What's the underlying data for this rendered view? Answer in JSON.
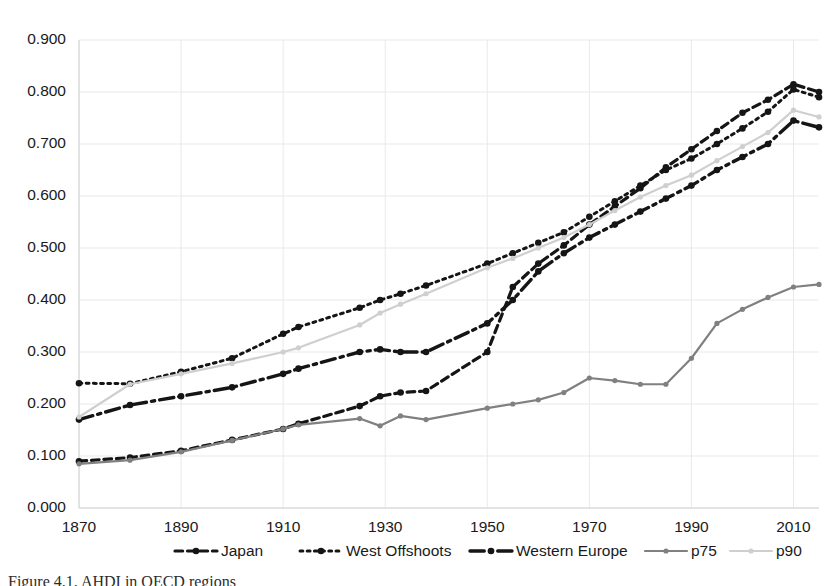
{
  "caption": "Figure 4.1. AHDI in OECD regions",
  "chart_data": {
    "type": "line",
    "title": "",
    "subtitle": "",
    "xlabel": "",
    "ylabel": "",
    "xlim": [
      1870,
      2015
    ],
    "ylim": [
      0.0,
      0.9
    ],
    "grid": true,
    "legend_position": "bottom",
    "x_ticks": [
      1870,
      1890,
      1910,
      1930,
      1950,
      1970,
      1990,
      2010
    ],
    "x_tick_labels": [
      "1870",
      "1890",
      "1910",
      "1930",
      "1950",
      "1970",
      "1990",
      "2010"
    ],
    "y_ticks": [
      0.0,
      0.1,
      0.2,
      0.3,
      0.4,
      0.5,
      0.6,
      0.7,
      0.8,
      0.9
    ],
    "y_tick_labels": [
      "0.000",
      "0.100",
      "0.200",
      "0.300",
      "0.400",
      "0.500",
      "0.600",
      "0.700",
      "0.800",
      "0.900"
    ],
    "x": [
      1870,
      1880,
      1890,
      1900,
      1910,
      1913,
      1925,
      1929,
      1933,
      1938,
      1950,
      1955,
      1960,
      1965,
      1970,
      1975,
      1980,
      1985,
      1990,
      1995,
      2000,
      2005,
      2010,
      2015
    ],
    "series": [
      {
        "name": "Japan",
        "style": "dashed",
        "color": "#151515",
        "values": [
          0.09,
          0.097,
          0.11,
          0.131,
          0.152,
          0.162,
          0.196,
          0.215,
          0.222,
          0.225,
          0.3,
          0.425,
          0.47,
          0.505,
          0.545,
          0.58,
          0.615,
          0.655,
          0.69,
          0.725,
          0.76,
          0.785,
          0.815,
          0.8
        ]
      },
      {
        "name": "West Offshoots",
        "style": "dotted",
        "color": "#151515",
        "values": [
          0.24,
          0.239,
          0.262,
          0.288,
          0.335,
          0.348,
          0.385,
          0.4,
          0.412,
          0.428,
          0.47,
          0.49,
          0.51,
          0.53,
          0.56,
          0.59,
          0.62,
          0.65,
          0.672,
          0.7,
          0.73,
          0.762,
          0.805,
          0.79
        ]
      },
      {
        "name": "Western Europe",
        "style": "dashdot",
        "color": "#151515",
        "values": [
          0.17,
          0.198,
          0.215,
          0.232,
          0.258,
          0.268,
          0.3,
          0.305,
          0.3,
          0.3,
          0.355,
          0.4,
          0.455,
          0.49,
          0.52,
          0.545,
          0.57,
          0.595,
          0.62,
          0.65,
          0.675,
          0.7,
          0.745,
          0.732
        ]
      },
      {
        "name": "p75",
        "style": "solid",
        "color": "#808080",
        "values": [
          0.085,
          0.092,
          0.108,
          0.13,
          0.152,
          0.16,
          0.172,
          0.158,
          0.177,
          0.17,
          0.192,
          0.2,
          0.208,
          0.222,
          0.25,
          0.245,
          0.238,
          0.238,
          0.288,
          0.355,
          0.382,
          0.405,
          0.425,
          0.43
        ]
      },
      {
        "name": "p90",
        "style": "solid",
        "color": "#cfcfcf",
        "values": [
          0.175,
          0.238,
          0.258,
          0.278,
          0.3,
          0.308,
          0.352,
          0.375,
          0.392,
          0.412,
          0.462,
          0.48,
          0.5,
          0.52,
          0.545,
          0.572,
          0.598,
          0.62,
          0.64,
          0.668,
          0.695,
          0.722,
          0.765,
          0.752
        ]
      }
    ]
  },
  "legend": {
    "items": [
      {
        "label": "Japan"
      },
      {
        "label": "West Offshoots"
      },
      {
        "label": "Western Europe"
      },
      {
        "label": "p75"
      },
      {
        "label": "p90"
      }
    ]
  }
}
